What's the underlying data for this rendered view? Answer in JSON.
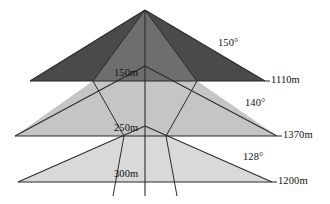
{
  "figure": {
    "type": "diagram",
    "background_color": "#ffffff",
    "line_color": "#2b2b2b",
    "text_color": "#111111",
    "axis": {
      "name": "central-vertical-axis",
      "x": 145,
      "y_top": 10,
      "y_bottom": 196
    },
    "apex": {
      "x": 145,
      "y": 10
    },
    "tiers": [
      {
        "name": "upper-tier",
        "height_label": "150m",
        "width_label": "1110m",
        "angle_label": "150°",
        "fill_color": "#4a4a4a",
        "baseline_y": 81,
        "left_x": 30,
        "right_x": 265
      },
      {
        "name": "middle-tier",
        "height_label": "250m",
        "width_label": "1370m",
        "angle_label": "140°",
        "fill_color": "#c5c5c5",
        "baseline_y": 136,
        "left_x": 15,
        "right_x": 277
      },
      {
        "name": "lower-tier",
        "height_label": "300m",
        "width_label": "1200m",
        "angle_label": "128°",
        "fill_color": "#d9d9d9",
        "baseline_y": 182,
        "left_x": 18,
        "right_x": 272
      }
    ],
    "inner_cone": {
      "name": "inner-cone",
      "fill_color": "#6e6e6e",
      "left_x_at_bottom": 37,
      "right_x_at_bottom": 252
    },
    "labels": {
      "height_150m": "150m",
      "height_250m": "250m",
      "height_300m": "300m",
      "width_1110m": "1110m",
      "width_1370m": "1370m",
      "width_1200m": "1200m",
      "angle_150": "150°",
      "angle_140": "140°",
      "angle_128": "128°"
    }
  }
}
